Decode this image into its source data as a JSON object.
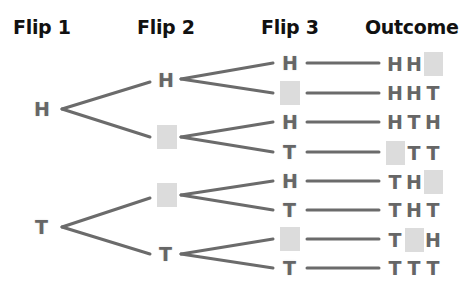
{
  "headers": {
    "flip1": "Flip 1",
    "flip2": "Flip 2",
    "flip3": "Flip 3",
    "outcome": "Outcome"
  },
  "flip1": [
    {
      "label": "H"
    },
    {
      "label": "T"
    }
  ],
  "flip2": [
    {
      "label": "H"
    },
    {
      "label": ""
    },
    {
      "label": ""
    },
    {
      "label": "T"
    }
  ],
  "flip3": [
    {
      "label": "H"
    },
    {
      "label": ""
    },
    {
      "label": "H"
    },
    {
      "label": "T"
    },
    {
      "label": "H"
    },
    {
      "label": "T"
    },
    {
      "label": ""
    },
    {
      "label": "T"
    }
  ],
  "outcomes": [
    [
      "H",
      "H",
      ""
    ],
    [
      "H",
      "H",
      "T"
    ],
    [
      "H",
      "T",
      "H"
    ],
    [
      "",
      "T",
      "T"
    ],
    [
      "T",
      "H",
      ""
    ],
    [
      "T",
      "H",
      "T"
    ],
    [
      "T",
      "",
      "H"
    ],
    [
      "T",
      "T",
      "T"
    ]
  ],
  "colors": {
    "line": "#6b6b6b",
    "blank": "#dcdcdc",
    "text": "#666666",
    "header": "#111111"
  }
}
